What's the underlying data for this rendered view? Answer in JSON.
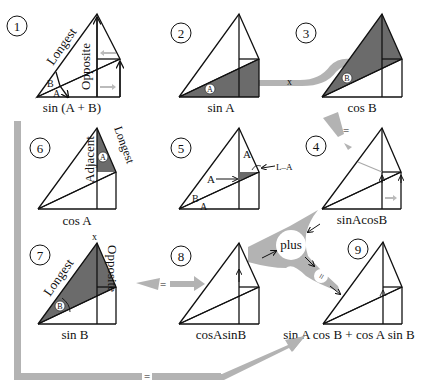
{
  "colors": {
    "line": "#111111",
    "shade": "#6b6b6b",
    "arrow": "#b3b3b3",
    "background": "#ffffff"
  },
  "panels": [
    {
      "number": "1",
      "caption": "sin (A + B)",
      "labels": {
        "longest": "Longest",
        "opposite": "Opposite",
        "angle_a": "A",
        "angle_b": "B"
      }
    },
    {
      "number": "2",
      "caption": "sin A",
      "labels": {
        "angle": "A"
      }
    },
    {
      "number": "3",
      "caption": "cos B",
      "labels": {
        "angle": "B"
      }
    },
    {
      "number": "4",
      "caption": "sinAcosB"
    },
    {
      "number": "5",
      "caption": "",
      "labels": {
        "angle_top": "A",
        "angle_mid": "A",
        "angle_b": "B",
        "angle_a": "A",
        "right_minus_a": "L–A"
      }
    },
    {
      "number": "6",
      "caption": "cos A",
      "labels": {
        "adjacent": "Adjacent",
        "longest": "Longest",
        "angle": "A"
      }
    },
    {
      "number": "7",
      "caption": "sin B",
      "labels": {
        "longest": "Longest",
        "opposite": "Opposite",
        "angle": "B",
        "x": "x"
      }
    },
    {
      "number": "8",
      "caption": "cosAsinB"
    },
    {
      "number": "9",
      "caption": "sin A cos B + cos A sin B"
    }
  ],
  "connectors": {
    "x_label": "x",
    "equals": "=",
    "plus": "plus"
  }
}
